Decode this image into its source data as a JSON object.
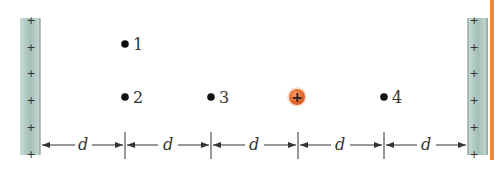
{
  "figure": {
    "colors": {
      "plate": "#a8c4bd",
      "plate_edge": "#6f8a84",
      "charge": "#e8692a",
      "accent_bar": "#ef8a3c",
      "ink": "#333333"
    },
    "left_plate": {
      "sign": "+",
      "plus_count": 6
    },
    "right_plate": {
      "sign": "+",
      "plus_count": 6
    },
    "points": [
      {
        "label": "1"
      },
      {
        "label": "2"
      },
      {
        "label": "3"
      },
      {
        "label": "4"
      }
    ],
    "charge": {
      "symbol": "+"
    },
    "spacing_labels": [
      "d",
      "d",
      "d",
      "d",
      "d"
    ]
  }
}
